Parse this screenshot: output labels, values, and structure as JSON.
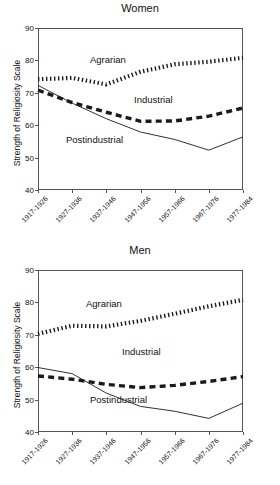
{
  "axis": {
    "ylabel": "Strength of Religiosity Scale",
    "yticks": [
      "90",
      "80",
      "70",
      "60",
      "50",
      "40"
    ],
    "xticks": [
      "1917-1926",
      "1927-1936",
      "1937-1946",
      "1947-1956",
      "1957-1966",
      "1967-1976",
      "1977-1984"
    ]
  },
  "series_labels": {
    "agrarian": "Agrarian",
    "industrial": "Industrial",
    "postindustrial": "Postindustrial"
  },
  "chart_data": [
    {
      "type": "line",
      "title": "Women",
      "xlabel": "",
      "ylabel": "Strength of Religiosity Scale",
      "ylim": [
        40,
        90
      ],
      "grid": false,
      "legend": "inline-annotations",
      "categories": [
        "1917-1926",
        "1927-1936",
        "1937-1946",
        "1947-1956",
        "1957-1966",
        "1967-1976",
        "1977-1984"
      ],
      "series": [
        {
          "name": "Agrarian",
          "style": "heavy-dotted",
          "values": [
            74.2,
            74.6,
            72.6,
            76.5,
            78.8,
            79.6,
            80.8
          ]
        },
        {
          "name": "Industrial",
          "style": "thick-dashed",
          "values": [
            70.8,
            67.0,
            64.0,
            61.2,
            61.3,
            62.8,
            65.3
          ]
        },
        {
          "name": "Postindustrial",
          "style": "thin-solid",
          "values": [
            72.3,
            66.8,
            62.0,
            57.9,
            55.6,
            52.3,
            56.4
          ]
        }
      ]
    },
    {
      "type": "line",
      "title": "Men",
      "xlabel": "",
      "ylabel": "Strength of Religiosity Scale",
      "ylim": [
        40,
        90
      ],
      "grid": false,
      "legend": "inline-annotations",
      "categories": [
        "1917-1926",
        "1927-1936",
        "1937-1946",
        "1947-1956",
        "1957-1966",
        "1967-1976",
        "1977-1984"
      ],
      "series": [
        {
          "name": "Agrarian",
          "style": "heavy-dotted",
          "values": [
            70.3,
            72.8,
            72.6,
            74.3,
            76.5,
            78.8,
            80.8
          ]
        },
        {
          "name": "Industrial",
          "style": "thick-dashed",
          "values": [
            57.3,
            56.3,
            54.7,
            53.7,
            54.4,
            55.6,
            57.1
          ]
        },
        {
          "name": "Postindustrial",
          "style": "thin-solid",
          "values": [
            59.9,
            58.0,
            52.0,
            47.9,
            46.4,
            44.2,
            48.9
          ]
        }
      ]
    }
  ]
}
